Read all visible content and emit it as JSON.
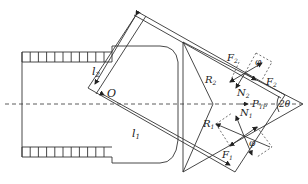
{
  "figure": {
    "type": "mechanical force diagram",
    "labels": {
      "l1": "l",
      "l1_sub": "1",
      "l2": "l",
      "l2_sub": "2",
      "origin": "O",
      "F1": "F",
      "F1_sub": "1",
      "F2": "F",
      "F2_sub": "2",
      "R1": "R",
      "R1_sub": "1",
      "R2": "R",
      "R2_sub": "2",
      "N1": "N",
      "N1_sub": "1",
      "N2": "N",
      "N2_sub": "2",
      "P": "P",
      "P_sub": "TP",
      "angle_2theta": "2θ",
      "phi_top": "φ",
      "phi_bottom": "φ"
    },
    "colors": {
      "line": "#333333",
      "background": "#ffffff"
    }
  }
}
